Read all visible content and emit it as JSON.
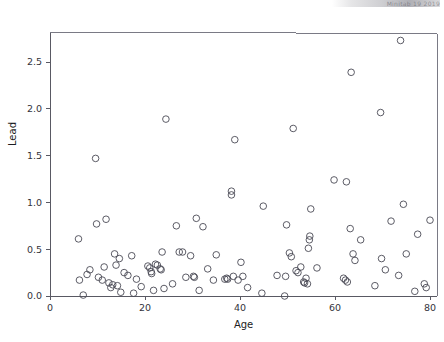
{
  "figure": {
    "width": 444,
    "height": 342,
    "background": "#ffffff",
    "marker_color": "#4a4a55",
    "axis_color": "#595963",
    "frame_color": "#7a7a85",
    "top_edge_artifact": "Minitab 19 2019"
  },
  "chart_data": {
    "type": "scatter",
    "title": "",
    "subtitle": "",
    "xlabel": "Age",
    "ylabel": "Lead",
    "xlim": [
      0,
      81.5
    ],
    "ylim": [
      -0.08,
      2.82
    ],
    "xticks": [
      0,
      20,
      40,
      60,
      80
    ],
    "xticklabels": [
      "0",
      "20",
      "40",
      "60",
      "80"
    ],
    "yticks": [
      0.0,
      0.5,
      1.0,
      1.5,
      2.0,
      2.5
    ],
    "yticklabels": [
      "0.0",
      "0.5",
      "1.0",
      "1.5",
      "2.0",
      "2.5"
    ],
    "grid": false,
    "legend": false,
    "marker": "open-circle",
    "marker_size": 3.3,
    "series": [
      {
        "name": "Lead vs Age",
        "points": [
          [
            6.0,
            0.61
          ],
          [
            6.2,
            0.17
          ],
          [
            7.0,
            0.01
          ],
          [
            7.8,
            0.23
          ],
          [
            8.4,
            0.28
          ],
          [
            9.6,
            1.47
          ],
          [
            9.8,
            0.77
          ],
          [
            10.2,
            0.2
          ],
          [
            11.0,
            0.17
          ],
          [
            11.4,
            0.31
          ],
          [
            11.8,
            0.82
          ],
          [
            12.4,
            0.14
          ],
          [
            12.8,
            0.09
          ],
          [
            13.2,
            0.12
          ],
          [
            13.6,
            0.45
          ],
          [
            13.9,
            0.33
          ],
          [
            14.2,
            0.11
          ],
          [
            14.6,
            0.4
          ],
          [
            14.9,
            0.04
          ],
          [
            15.6,
            0.25
          ],
          [
            16.4,
            0.22
          ],
          [
            17.2,
            0.43
          ],
          [
            17.6,
            0.03
          ],
          [
            18.2,
            0.18
          ],
          [
            19.2,
            0.1
          ],
          [
            20.6,
            0.32
          ],
          [
            21.0,
            0.3
          ],
          [
            21.3,
            0.26
          ],
          [
            21.4,
            0.24
          ],
          [
            21.8,
            0.06
          ],
          [
            22.2,
            0.34
          ],
          [
            22.6,
            0.33
          ],
          [
            23.2,
            0.29
          ],
          [
            23.4,
            0.28
          ],
          [
            23.6,
            0.47
          ],
          [
            24.0,
            0.08
          ],
          [
            24.4,
            1.89
          ],
          [
            25.8,
            0.13
          ],
          [
            26.6,
            0.75
          ],
          [
            27.2,
            0.47
          ],
          [
            27.9,
            0.47
          ],
          [
            28.6,
            0.2
          ],
          [
            29.6,
            0.43
          ],
          [
            30.2,
            0.21
          ],
          [
            30.4,
            0.2
          ],
          [
            30.8,
            0.83
          ],
          [
            31.4,
            0.06
          ],
          [
            32.2,
            0.74
          ],
          [
            33.2,
            0.29
          ],
          [
            34.4,
            0.17
          ],
          [
            35.0,
            0.44
          ],
          [
            36.8,
            0.18
          ],
          [
            37.2,
            0.19
          ],
          [
            37.4,
            0.18
          ],
          [
            38.2,
            1.12
          ],
          [
            38.2,
            1.08
          ],
          [
            38.6,
            0.21
          ],
          [
            38.9,
            1.67
          ],
          [
            39.6,
            0.17
          ],
          [
            40.2,
            0.36
          ],
          [
            40.6,
            0.21
          ],
          [
            41.6,
            0.09
          ],
          [
            44.6,
            0.03
          ],
          [
            44.9,
            0.96
          ],
          [
            47.8,
            0.22
          ],
          [
            49.4,
            0.0
          ],
          [
            49.6,
            0.21
          ],
          [
            49.8,
            0.76
          ],
          [
            50.4,
            0.46
          ],
          [
            50.8,
            0.42
          ],
          [
            51.2,
            1.79
          ],
          [
            51.8,
            0.27
          ],
          [
            52.2,
            0.25
          ],
          [
            52.8,
            0.31
          ],
          [
            53.4,
            0.15
          ],
          [
            53.6,
            0.14
          ],
          [
            53.9,
            0.19
          ],
          [
            54.2,
            0.13
          ],
          [
            54.4,
            0.51
          ],
          [
            54.6,
            0.6
          ],
          [
            54.7,
            0.64
          ],
          [
            54.9,
            0.93
          ],
          [
            56.2,
            0.3
          ],
          [
            59.8,
            1.24
          ],
          [
            61.8,
            0.19
          ],
          [
            62.2,
            0.17
          ],
          [
            62.6,
            0.15
          ],
          [
            62.4,
            1.22
          ],
          [
            63.2,
            0.72
          ],
          [
            63.4,
            2.39
          ],
          [
            63.8,
            0.45
          ],
          [
            64.2,
            0.38
          ],
          [
            65.4,
            0.6
          ],
          [
            68.4,
            0.11
          ],
          [
            69.6,
            1.96
          ],
          [
            69.8,
            0.4
          ],
          [
            70.6,
            0.28
          ],
          [
            71.8,
            0.8
          ],
          [
            73.4,
            0.22
          ],
          [
            73.8,
            2.73
          ],
          [
            74.4,
            0.98
          ],
          [
            75.0,
            0.45
          ],
          [
            76.8,
            0.05
          ],
          [
            77.4,
            0.66
          ],
          [
            78.8,
            0.13
          ],
          [
            79.2,
            0.09
          ],
          [
            80.0,
            0.81
          ]
        ]
      }
    ]
  }
}
